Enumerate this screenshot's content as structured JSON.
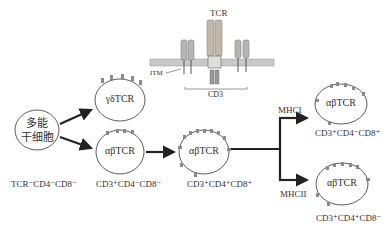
{
  "diagram": {
    "receptor_inset": {
      "tcr_label": "TCR",
      "itm_label": "ITM",
      "cd3_label": "CD3",
      "tcr_chain_labels": [
        "α",
        "β"
      ],
      "zeta_labels": [
        "ζ",
        "ζ"
      ]
    },
    "cells": {
      "stem": {
        "line1": "多能",
        "line2": "干细胞",
        "phenotype": "TCR⁻CD4⁻CD8⁻"
      },
      "gd": {
        "label": "γδTCR"
      },
      "ab_dn": {
        "label": "αβTCR",
        "phenotype": "CD3⁺CD4⁻CD8⁻"
      },
      "ab_dp": {
        "label": "αβTCR",
        "phenotype": "CD3⁺CD4⁺CD8⁺"
      },
      "ab_cd8": {
        "label": "αβTCR",
        "phenotype": "CD3⁺CD4⁻CD8⁺"
      },
      "ab_cd4": {
        "label": "αβTCR",
        "phenotype": "CD3⁺CD4⁺CD8⁻"
      }
    },
    "branches": {
      "upper": "MHCI",
      "lower": "MHCII"
    },
    "colors": {
      "line": "#2a2a2a",
      "receptor_fill": "#b8b8b8",
      "membrane_fill": "#c8c8c8",
      "receptor_dark": "#555555"
    }
  }
}
